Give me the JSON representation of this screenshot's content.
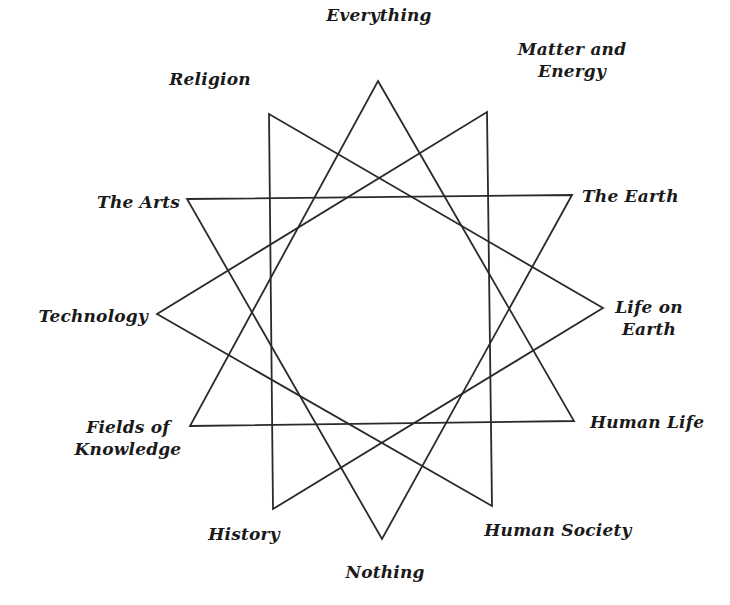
{
  "diagram": {
    "type": "twelve-pointed star of four overlapping triangles",
    "line_color": "#2a2a2a",
    "background": "#ffffff",
    "vertices": [
      {
        "id": 0,
        "label": [
          "Everything"
        ],
        "x": 378,
        "y": 81
      },
      {
        "id": 1,
        "label": [
          "Matter and",
          "Energy"
        ],
        "x": 487,
        "y": 112
      },
      {
        "id": 2,
        "label": [
          "The Earth"
        ],
        "x": 572,
        "y": 195
      },
      {
        "id": 3,
        "label": [
          "Life on",
          "Earth"
        ],
        "x": 603,
        "y": 308
      },
      {
        "id": 4,
        "label": [
          "Human Life"
        ],
        "x": 574,
        "y": 421
      },
      {
        "id": 5,
        "label": [
          "Human Society"
        ],
        "x": 492,
        "y": 506
      },
      {
        "id": 6,
        "label": [
          "Nothing"
        ],
        "x": 382,
        "y": 539
      },
      {
        "id": 7,
        "label": [
          "History"
        ],
        "x": 273,
        "y": 509
      },
      {
        "id": 8,
        "label": [
          "Fields of",
          "Knowledge"
        ],
        "x": 190,
        "y": 426
      },
      {
        "id": 9,
        "label": [
          "Technology"
        ],
        "x": 157,
        "y": 314
      },
      {
        "id": 10,
        "label": [
          "The Arts"
        ],
        "x": 187,
        "y": 199
      },
      {
        "id": 11,
        "label": [
          "Religion"
        ],
        "x": 269,
        "y": 114
      }
    ],
    "triangles": [
      [
        0,
        4,
        8
      ],
      [
        1,
        5,
        9
      ],
      [
        2,
        6,
        10
      ],
      [
        3,
        7,
        11
      ]
    ]
  },
  "labels": {
    "everything": "Everything",
    "matter_energy_1": "Matter and",
    "matter_energy_2": "Energy",
    "the_earth": "The Earth",
    "life_on_earth_1": "Life on",
    "life_on_earth_2": "Earth",
    "human_life": "Human Life",
    "human_society": "Human Society",
    "nothing": "Nothing",
    "history": "History",
    "fields_of_knowledge_1": "Fields of",
    "fields_of_knowledge_2": "Knowledge",
    "technology": "Technology",
    "the_arts": "The Arts",
    "religion": "Religion"
  }
}
